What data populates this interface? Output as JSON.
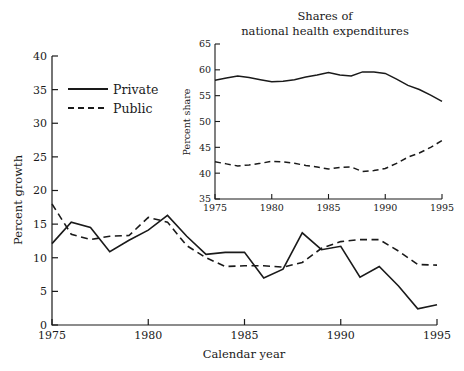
{
  "chart_data": [
    {
      "id": "main",
      "type": "line",
      "title": "",
      "xlabel": "Calendar year",
      "ylabel": "Percent growth",
      "xlim": [
        1975,
        1995
      ],
      "ylim": [
        0,
        40
      ],
      "xticks": [
        1975,
        1980,
        1985,
        1990,
        1995
      ],
      "xtick_labels": [
        "1975",
        "1980",
        "1985",
        "1990",
        "1995"
      ],
      "yticks": [
        0,
        5,
        10,
        15,
        20,
        25,
        30,
        35,
        40
      ],
      "ytick_labels": [
        "0",
        "5",
        "10",
        "15",
        "20",
        "25",
        "30",
        "35",
        "40"
      ],
      "grid": false,
      "legend_position": "upper-left",
      "x": [
        1975,
        1976,
        1977,
        1978,
        1979,
        1980,
        1981,
        1982,
        1983,
        1984,
        1985,
        1986,
        1987,
        1988,
        1989,
        1990,
        1991,
        1992,
        1993,
        1994,
        1995
      ],
      "series": [
        {
          "name": "Private",
          "style": "solid",
          "values": [
            12.1,
            15.3,
            14.5,
            10.9,
            12.6,
            14.1,
            16.3,
            13.2,
            10.5,
            10.8,
            10.8,
            7.0,
            8.3,
            13.7,
            11.2,
            11.7,
            7.1,
            8.7,
            5.8,
            2.4,
            3.0
          ]
        },
        {
          "name": "Public",
          "style": "dashed",
          "values": [
            18.0,
            13.5,
            12.7,
            13.2,
            13.3,
            16.0,
            15.3,
            11.8,
            10.0,
            8.7,
            8.8,
            8.8,
            8.6,
            9.3,
            11.4,
            12.4,
            12.7,
            12.7,
            11.0,
            9.0,
            8.9
          ]
        }
      ]
    },
    {
      "id": "inset",
      "type": "line",
      "title": "Shares of national health expenditures",
      "title_line_1": "Shares of",
      "title_line_2": "national health expenditures",
      "xlabel": "",
      "ylabel": "Percent share",
      "xlim": [
        1975,
        1995
      ],
      "ylim": [
        35,
        65
      ],
      "xticks": [
        1975,
        1980,
        1985,
        1990,
        1995
      ],
      "xtick_labels": [
        "1975",
        "1980",
        "1985",
        "1990",
        "1995"
      ],
      "yticks": [
        35,
        40,
        45,
        50,
        55,
        60,
        65
      ],
      "ytick_labels": [
        "35",
        "40",
        "45",
        "50",
        "55",
        "60",
        "65"
      ],
      "grid": false,
      "legend_position": "none",
      "x": [
        1975,
        1976,
        1977,
        1978,
        1979,
        1980,
        1981,
        1982,
        1983,
        1984,
        1985,
        1986,
        1987,
        1988,
        1989,
        1990,
        1991,
        1992,
        1993,
        1994,
        1995
      ],
      "series": [
        {
          "name": "Private",
          "style": "solid",
          "values": [
            58.0,
            58.4,
            58.8,
            58.5,
            58.1,
            57.7,
            57.8,
            58.1,
            58.6,
            59.0,
            59.5,
            59.0,
            58.8,
            59.6,
            59.6,
            59.3,
            58.2,
            57.0,
            56.2,
            55.1,
            53.9
          ]
        },
        {
          "name": "Public",
          "style": "dashed",
          "values": [
            42.2,
            41.8,
            41.4,
            41.6,
            41.9,
            42.3,
            42.2,
            41.9,
            41.5,
            41.2,
            40.8,
            41.1,
            41.2,
            40.3,
            40.5,
            40.9,
            41.9,
            43.1,
            43.9,
            45.0,
            46.3
          ]
        }
      ]
    }
  ],
  "legend": {
    "items": [
      {
        "label": "Private",
        "style": "solid"
      },
      {
        "label": "Public",
        "style": "dashed"
      }
    ]
  },
  "colors": {
    "line": "#1a1a1a",
    "axis": "#1a1a1a",
    "background": "#ffffff"
  }
}
